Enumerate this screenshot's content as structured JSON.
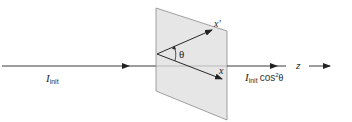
{
  "diagram": {
    "colors": {
      "line": "#3a3a3a",
      "plane_fill": "#e6e6e6",
      "plane_stroke": "#8a8a8a",
      "background": "#ffffff"
    },
    "labels": {
      "incident_intensity_symbol": "I",
      "incident_intensity_sub": "init",
      "transmitted_intensity_symbol": "I",
      "transmitted_intensity_sub": "init",
      "transmitted_intensity_expr": "cos",
      "transmitted_intensity_power": "2",
      "transmitted_intensity_angle": "θ",
      "axis_x_prime": "x′",
      "axis_x": "x",
      "angle": "θ",
      "propagation_axis": "z"
    }
  }
}
